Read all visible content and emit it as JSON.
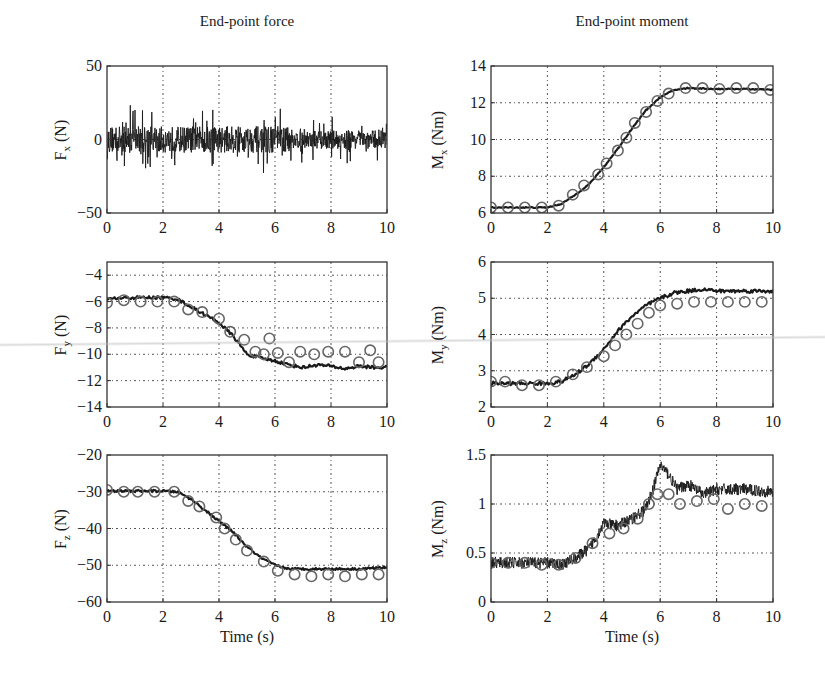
{
  "figure": {
    "columns": [
      {
        "title": "End-point force"
      },
      {
        "title": "End-point moment"
      }
    ],
    "xlabel": "Time (s)"
  },
  "chart_data": [
    {
      "id": "fx",
      "type": "line",
      "column": 0,
      "row": 0,
      "ylabel_main": "F",
      "ylabel_sub": "x",
      "ylabel_unit": " (N)",
      "xlabel": "",
      "xlim": [
        0,
        10
      ],
      "ylim": [
        -50,
        50
      ],
      "xticks": [
        0,
        2,
        4,
        6,
        8,
        10
      ],
      "yticks": [
        -50,
        0,
        50
      ],
      "yticklabels": [
        "−50",
        "0",
        "50"
      ],
      "grid": true,
      "box": [
        107,
        66,
        387,
        213
      ],
      "series": [
        {
          "name": "measured",
          "style": "noisy-line",
          "noise": 9,
          "spikes": 22,
          "x": [
            0,
            1,
            2,
            3,
            4,
            5,
            6,
            7,
            8,
            9,
            10
          ],
          "y": [
            0,
            0,
            0,
            0,
            0,
            0,
            0,
            0,
            0,
            0,
            0
          ]
        }
      ]
    },
    {
      "id": "mx",
      "type": "line",
      "column": 1,
      "row": 0,
      "ylabel_main": "M",
      "ylabel_sub": "x",
      "ylabel_unit": " (Nm)",
      "xlabel": "",
      "xlim": [
        0,
        10
      ],
      "ylim": [
        6,
        14
      ],
      "xticks": [
        0,
        2,
        4,
        6,
        8,
        10
      ],
      "yticks": [
        6,
        8,
        10,
        12,
        14
      ],
      "yticklabels": [
        "6",
        "8",
        "10",
        "12",
        "14"
      ],
      "grid": true,
      "box": [
        491,
        66,
        773,
        213
      ],
      "series": [
        {
          "name": "measured",
          "style": "line",
          "noise": 0.03,
          "x": [
            0,
            1,
            2,
            2.5,
            3,
            3.5,
            4,
            4.5,
            5,
            5.5,
            6,
            6.5,
            7,
            8,
            9,
            10
          ],
          "y": [
            6.3,
            6.3,
            6.3,
            6.5,
            7.0,
            7.6,
            8.5,
            9.5,
            10.6,
            11.6,
            12.3,
            12.7,
            12.8,
            12.75,
            12.75,
            12.7
          ]
        },
        {
          "name": "predicted",
          "style": "markers",
          "x": [
            0,
            0.6,
            1.2,
            1.8,
            2.4,
            2.9,
            3.3,
            3.8,
            4.1,
            4.5,
            4.8,
            5.1,
            5.5,
            5.9,
            6.3,
            6.9,
            7.5,
            8.1,
            8.7,
            9.3,
            9.9
          ],
          "y": [
            6.3,
            6.3,
            6.3,
            6.3,
            6.4,
            7.0,
            7.5,
            8.1,
            8.7,
            9.4,
            10.1,
            10.9,
            11.5,
            12.1,
            12.5,
            12.8,
            12.8,
            12.75,
            12.8,
            12.8,
            12.7
          ]
        }
      ]
    },
    {
      "id": "fy",
      "type": "line",
      "column": 0,
      "row": 1,
      "ylabel_main": "F",
      "ylabel_sub": "y",
      "ylabel_unit": " (N)",
      "xlabel": "",
      "xlim": [
        0,
        10
      ],
      "ylim": [
        -14,
        -3
      ],
      "xticks": [
        0,
        2,
        4,
        6,
        8,
        10
      ],
      "yticks": [
        -14,
        -12,
        -10,
        -8,
        -6,
        -4
      ],
      "yticklabels": [
        "−14",
        "−12",
        "−10",
        "−8",
        "−6",
        "−4"
      ],
      "grid": true,
      "box": [
        107,
        262,
        387,
        407
      ],
      "series": [
        {
          "name": "measured",
          "style": "line",
          "noise": 0.12,
          "x": [
            0,
            1,
            2,
            2.5,
            3,
            3.5,
            4,
            4.5,
            5,
            5.5,
            6,
            6.5,
            7,
            7.5,
            8,
            8.5,
            9,
            9.5,
            10
          ],
          "y": [
            -5.8,
            -5.7,
            -5.7,
            -5.8,
            -6.4,
            -7.0,
            -7.6,
            -8.6,
            -10.0,
            -10.3,
            -10.5,
            -10.8,
            -11.0,
            -10.8,
            -10.9,
            -11.1,
            -10.9,
            -11.0,
            -11.0
          ]
        },
        {
          "name": "predicted",
          "style": "markers",
          "x": [
            0,
            0.6,
            1.2,
            1.8,
            2.4,
            2.9,
            3.4,
            4.0,
            4.4,
            4.9,
            5.3,
            5.6,
            5.8,
            6.1,
            6.5,
            6.9,
            7.4,
            7.9,
            8.5,
            9.0,
            9.4,
            9.7
          ],
          "y": [
            -6.1,
            -5.9,
            -6.0,
            -6.0,
            -6.0,
            -6.6,
            -6.8,
            -7.3,
            -8.3,
            -8.9,
            -9.8,
            -10.0,
            -8.8,
            -9.9,
            -10.6,
            -9.8,
            -10.0,
            -9.8,
            -9.8,
            -10.6,
            -9.7,
            -10.6
          ]
        }
      ]
    },
    {
      "id": "my",
      "type": "line",
      "column": 1,
      "row": 1,
      "ylabel_main": "M",
      "ylabel_sub": "y",
      "ylabel_unit": " (Nm)",
      "xlabel": "",
      "xlim": [
        0,
        10
      ],
      "ylim": [
        2,
        6
      ],
      "xticks": [
        0,
        2,
        4,
        6,
        8,
        10
      ],
      "yticks": [
        2,
        3,
        4,
        5,
        6
      ],
      "yticklabels": [
        "2",
        "3",
        "4",
        "5",
        "6"
      ],
      "grid": true,
      "box": [
        491,
        262,
        773,
        407
      ],
      "series": [
        {
          "name": "measured",
          "style": "line",
          "noise": 0.05,
          "x": [
            0,
            1,
            2,
            2.5,
            3,
            3.5,
            4,
            4.5,
            5,
            5.5,
            6,
            6.5,
            7,
            7.5,
            8,
            9,
            10
          ],
          "y": [
            2.65,
            2.65,
            2.65,
            2.7,
            2.9,
            3.2,
            3.6,
            4.1,
            4.5,
            4.8,
            5.0,
            5.15,
            5.2,
            5.25,
            5.2,
            5.2,
            5.2
          ]
        },
        {
          "name": "predicted",
          "style": "markers",
          "x": [
            0,
            0.5,
            1.1,
            1.7,
            2.3,
            2.9,
            3.4,
            4.0,
            4.4,
            4.8,
            5.2,
            5.6,
            6.0,
            6.6,
            7.2,
            7.8,
            8.4,
            9.0,
            9.6
          ],
          "y": [
            2.7,
            2.7,
            2.6,
            2.6,
            2.7,
            2.9,
            3.1,
            3.4,
            3.7,
            4.0,
            4.3,
            4.6,
            4.8,
            4.85,
            4.9,
            4.9,
            4.9,
            4.9,
            4.9
          ]
        }
      ]
    },
    {
      "id": "fz",
      "type": "line",
      "column": 0,
      "row": 2,
      "ylabel_main": "F",
      "ylabel_sub": "z",
      "ylabel_unit": " (N)",
      "xlabel": "Time (s)",
      "xlim": [
        0,
        10
      ],
      "ylim": [
        -60,
        -20
      ],
      "xticks": [
        0,
        2,
        4,
        6,
        8,
        10
      ],
      "yticks": [
        -60,
        -50,
        -40,
        -30,
        -20
      ],
      "yticklabels": [
        "−60",
        "−50",
        "−40",
        "−30",
        "−20"
      ],
      "grid": true,
      "box": [
        107,
        455,
        387,
        602
      ],
      "series": [
        {
          "name": "measured",
          "style": "line",
          "noise": 0.3,
          "x": [
            0,
            1,
            2,
            2.5,
            3,
            3.5,
            4,
            4.5,
            5,
            5.5,
            6,
            6.5,
            7,
            8,
            9,
            10
          ],
          "y": [
            -29.8,
            -29.8,
            -29.8,
            -30,
            -32,
            -35,
            -38,
            -41,
            -45,
            -48,
            -50,
            -51,
            -51,
            -51,
            -51,
            -50.5
          ]
        },
        {
          "name": "predicted",
          "style": "markers",
          "x": [
            0,
            0.6,
            1.1,
            1.7,
            2.4,
            2.9,
            3.3,
            3.9,
            4.2,
            4.6,
            5.0,
            5.6,
            6.1,
            6.7,
            7.3,
            7.9,
            8.5,
            9.1,
            9.7
          ],
          "y": [
            -29.5,
            -30,
            -30,
            -30,
            -30,
            -32.5,
            -34,
            -37,
            -40,
            -43,
            -46,
            -49,
            -51.5,
            -52.5,
            -53,
            -52.5,
            -53,
            -52.5,
            -52.5
          ]
        }
      ]
    },
    {
      "id": "mz",
      "type": "line",
      "column": 1,
      "row": 2,
      "ylabel_main": "M",
      "ylabel_sub": "z",
      "ylabel_unit": " (Nm)",
      "xlabel": "Time (s)",
      "xlim": [
        0,
        10
      ],
      "ylim": [
        0,
        1.5
      ],
      "xticks": [
        0,
        2,
        4,
        6,
        8,
        10
      ],
      "yticks": [
        0,
        0.5,
        1,
        1.5
      ],
      "yticklabels": [
        "0",
        "0.5",
        "1",
        "1.5"
      ],
      "grid": true,
      "box": [
        491,
        455,
        773,
        602
      ],
      "series": [
        {
          "name": "measured",
          "style": "noisy-line",
          "noise": 0.06,
          "spikes": 0,
          "x": [
            0,
            1,
            2,
            2.5,
            3,
            3.5,
            4,
            4.5,
            5,
            5.5,
            5.8,
            6.0,
            6.3,
            6.6,
            7,
            7.5,
            8,
            9,
            10
          ],
          "y": [
            0.4,
            0.4,
            0.4,
            0.38,
            0.45,
            0.55,
            0.8,
            0.78,
            0.85,
            0.95,
            1.2,
            1.4,
            1.3,
            1.15,
            1.2,
            1.1,
            1.15,
            1.15,
            1.12
          ]
        },
        {
          "name": "predicted",
          "style": "markers",
          "x": [
            0,
            0.6,
            1.2,
            1.8,
            2.4,
            3.0,
            3.6,
            4.2,
            4.7,
            5.2,
            5.6,
            5.9,
            6.3,
            6.7,
            7.3,
            7.9,
            8.4,
            9.0,
            9.6
          ],
          "y": [
            0.4,
            0.4,
            0.4,
            0.38,
            0.38,
            0.45,
            0.6,
            0.7,
            0.75,
            0.85,
            1.0,
            1.1,
            1.1,
            1.0,
            1.03,
            1.05,
            0.95,
            1.0,
            0.98
          ]
        }
      ]
    }
  ]
}
